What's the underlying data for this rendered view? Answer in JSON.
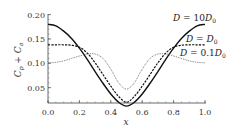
{
  "chart_data": {
    "type": "line",
    "title": "",
    "xlabel": "x",
    "ylabel": "C_p + C_a",
    "xlim": [
      0.0,
      1.0
    ],
    "ylim": [
      0.008,
      0.2
    ],
    "grid": false,
    "x_ticks": [
      "0.0",
      "0.2",
      "0.4",
      "0.6",
      "0.8",
      "1.0"
    ],
    "y_ticks": [
      "0.05",
      "0.10",
      "0.15",
      "0.20"
    ],
    "legend_position": "inline labels, upper right",
    "x": [
      0.0,
      0.05,
      0.1,
      0.15,
      0.2,
      0.25,
      0.3,
      0.35,
      0.4,
      0.45,
      0.5,
      0.55,
      0.6,
      0.65,
      0.7,
      0.75,
      0.8,
      0.85,
      0.9,
      0.95,
      1.0
    ],
    "series": [
      {
        "name": "D = 10D0",
        "label": "D = 10D₀",
        "style": "solid",
        "values": [
          0.18,
          0.177,
          0.166,
          0.151,
          0.131,
          0.108,
          0.083,
          0.059,
          0.037,
          0.02,
          0.012,
          0.02,
          0.037,
          0.059,
          0.083,
          0.108,
          0.131,
          0.151,
          0.166,
          0.177,
          0.18
        ]
      },
      {
        "name": "D = D0",
        "label": "D = D₀",
        "style": "dashed",
        "values": [
          0.138,
          0.138,
          0.138,
          0.137,
          0.133,
          0.121,
          0.101,
          0.077,
          0.053,
          0.032,
          0.02,
          0.032,
          0.053,
          0.077,
          0.101,
          0.121,
          0.133,
          0.137,
          0.138,
          0.138,
          0.138
        ]
      },
      {
        "name": "D = 0.1D0",
        "label": "D = 0.1D₀",
        "style": "dotted",
        "values": [
          0.101,
          0.102,
          0.105,
          0.11,
          0.115,
          0.119,
          0.119,
          0.11,
          0.088,
          0.06,
          0.047,
          0.06,
          0.088,
          0.11,
          0.119,
          0.119,
          0.115,
          0.11,
          0.105,
          0.102,
          0.101
        ]
      }
    ]
  },
  "axes": {
    "xlabel": "x",
    "ylabel_main": "C",
    "ylabel_sub1": "p",
    "ylabel_plus": " + ",
    "ylabel_sub2": "a"
  },
  "legend": {
    "solid": {
      "prefix": "D",
      "eq": " = 10",
      "var": "D",
      "sub": "0"
    },
    "dashed": {
      "prefix": "D",
      "eq": " = ",
      "var": "D",
      "sub": "0"
    },
    "dotted": {
      "prefix": "D",
      "eq": " = 0.1",
      "var": "D",
      "sub": "0"
    }
  }
}
